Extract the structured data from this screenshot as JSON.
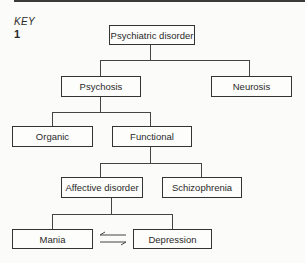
{
  "header": {
    "key_label": "KEY",
    "figure_number": "1"
  },
  "diagram": {
    "type": "tree",
    "nodes": {
      "root": "Psychiatric disorder",
      "psychosis": "Psychosis",
      "neurosis": "Neurosis",
      "organic": "Organic",
      "functional": "Functional",
      "affective": "Affective disorder",
      "schizophrenia": "Schizophrenia",
      "mania": "Mania",
      "depression": "Depression"
    },
    "edges": [
      [
        "Psychiatric disorder",
        "Psychosis"
      ],
      [
        "Psychiatric disorder",
        "Neurosis"
      ],
      [
        "Psychosis",
        "Organic"
      ],
      [
        "Psychosis",
        "Functional"
      ],
      [
        "Functional",
        "Affective disorder"
      ],
      [
        "Functional",
        "Schizophrenia"
      ],
      [
        "Affective disorder",
        "Mania"
      ],
      [
        "Affective disorder",
        "Depression"
      ]
    ],
    "bidirectional": [
      "Mania",
      "Depression"
    ]
  }
}
